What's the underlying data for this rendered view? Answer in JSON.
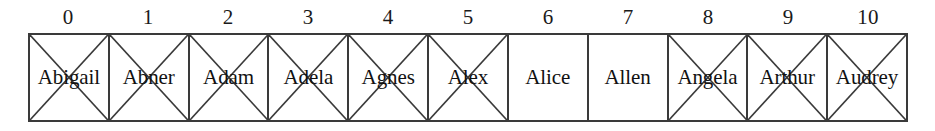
{
  "figure": {
    "cell_count": 11,
    "colors": {
      "background": "#ffffff",
      "line": "#3a3a3a",
      "text": "#111111"
    }
  },
  "indices": [
    {
      "label": "0"
    },
    {
      "label": "1"
    },
    {
      "label": "2"
    },
    {
      "label": "3"
    },
    {
      "label": "4"
    },
    {
      "label": "5"
    },
    {
      "label": "6"
    },
    {
      "label": "7"
    },
    {
      "label": "8"
    },
    {
      "label": "9"
    },
    {
      "label": "10"
    }
  ],
  "cells": [
    {
      "index": "0",
      "name": "Abigail",
      "crossed_out": true
    },
    {
      "index": "1",
      "name": "Abner",
      "crossed_out": true
    },
    {
      "index": "2",
      "name": "Adam",
      "crossed_out": true
    },
    {
      "index": "3",
      "name": "Adela",
      "crossed_out": true
    },
    {
      "index": "4",
      "name": "Agnes",
      "crossed_out": true
    },
    {
      "index": "5",
      "name": "Alex",
      "crossed_out": true
    },
    {
      "index": "6",
      "name": "Alice",
      "crossed_out": false
    },
    {
      "index": "7",
      "name": "Allen",
      "crossed_out": false
    },
    {
      "index": "8",
      "name": "Angela",
      "crossed_out": true
    },
    {
      "index": "9",
      "name": "Arthur",
      "crossed_out": true
    },
    {
      "index": "10",
      "name": "Audrey",
      "crossed_out": true
    }
  ]
}
